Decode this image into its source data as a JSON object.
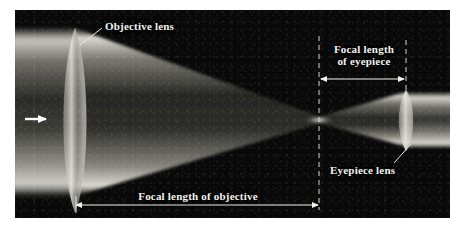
{
  "figure": {
    "background_color": "#ffffff",
    "panel_color": "#090909",
    "beam_color": "#e8e8e0",
    "annotation_color": "#f2f2ee"
  },
  "labels": {
    "objective_lens": "Objective lens",
    "eyepiece_lens": "Eyepiece lens",
    "focal_length_eyepiece_line1": "Focal length",
    "focal_length_eyepiece_line2": "of eyepiece",
    "focal_length_objective": "Focal length of objective"
  },
  "optics": {
    "objective_lens": {
      "name": "objective-lens",
      "center_x": 75,
      "center_y": 112,
      "height": 168,
      "width": 30
    },
    "eyepiece_lens": {
      "name": "eyepiece-lens",
      "center_x": 406,
      "center_y": 119,
      "height": 56,
      "width": 16
    },
    "focal_point_x": 319,
    "focal_point_y": 120,
    "object_arrow": {
      "name": "incoming-light-arrow",
      "x_start": 25,
      "x_end": 48,
      "y": 119,
      "direction": "right"
    }
  },
  "measurements": {
    "focal_length_objective": {
      "from_x": 75,
      "to_x": 319,
      "y": 205,
      "arrow_style": "double-headed"
    },
    "focal_length_eyepiece": {
      "from_x": 320,
      "to_x": 406,
      "y": 79,
      "arrow_style": "double-headed"
    }
  },
  "guides": {
    "dashed_line_focal_plane_x": 319,
    "dashed_line_eyepiece_x": 406
  }
}
